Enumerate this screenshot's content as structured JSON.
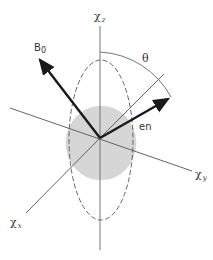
{
  "diagram": {
    "labels": {
      "chi_z": "χ",
      "chi_z_sub": "z",
      "chi_y": "χ",
      "chi_y_sub": "y",
      "chi_x": "χ",
      "chi_x_sub": "x",
      "b0": "B",
      "b0_sub": "0",
      "theta": "θ",
      "en": "en"
    },
    "colors": {
      "axis": "#666666",
      "arrow": "#1a1a1a",
      "ellipse_dash": "#555555",
      "shade": "#d4d4d4"
    }
  }
}
